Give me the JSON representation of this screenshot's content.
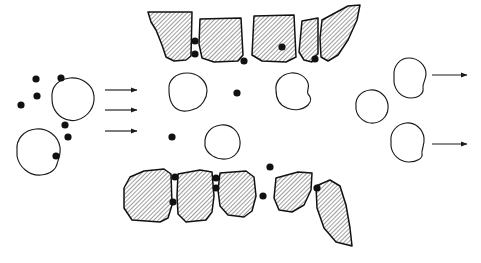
{
  "figure": {
    "domain_note": "schematic line diagram, black ink on white, no text labels",
    "background_color": "#ffffff",
    "ink_color": "#1a1a1a",
    "particle_color": "#111111",
    "hatch_color": "#1a1a1a",
    "width": 481,
    "height": 263,
    "stroke_width": 1.15,
    "hatch_angle_deg": 45,
    "hatch_spacing_px": 3
  },
  "regions": {
    "inlet": {
      "name": "inlet-region",
      "description": "feed side: large blobs plus scattered small particles"
    },
    "barrier": {
      "name": "barrier-region",
      "description": "two fractured hatched screen structures forming a throat"
    },
    "outlet": {
      "name": "outlet-region",
      "description": "discharge side: blobs only, particles retained upstream"
    }
  },
  "arrows": {
    "inlet": [
      {
        "name": "inlet-flow-arrow-1",
        "x1": 105,
        "y1": 90,
        "x2": 137,
        "y2": 90
      },
      {
        "name": "inlet-flow-arrow-2",
        "x1": 105,
        "y1": 110,
        "x2": 137,
        "y2": 110
      },
      {
        "name": "inlet-flow-arrow-3",
        "x1": 105,
        "y1": 131,
        "x2": 137,
        "y2": 131
      }
    ],
    "outlet": [
      {
        "name": "outlet-flow-arrow-1",
        "x1": 432,
        "y1": 75,
        "x2": 467,
        "y2": 75
      },
      {
        "name": "outlet-flow-arrow-2",
        "x1": 432,
        "y1": 144,
        "x2": 467,
        "y2": 144
      }
    ],
    "head_length": 7,
    "head_width": 5
  },
  "blobs": [
    {
      "name": "inlet-blob-upper",
      "cx": 72,
      "cy": 100,
      "rx": 22,
      "ry": 20,
      "path": "M 52 98 C 51 86 59 79 70 78 C 82 77 93 85 94 96 C 95 107 88 117 77 120 C 66 123 56 115 53 106 C 52 103 52 100 52 98 Z"
    },
    {
      "name": "inlet-blob-lower",
      "cx": 38,
      "cy": 152,
      "rx": 22,
      "ry": 21,
      "path": "M 17 150 C 16 139 24 130 36 129 C 48 128 58 136 60 147 C 61 155 58 160 57 164 C 56 169 51 174 41 175 C 29 176 19 167 17 156 C 17 154 17 152 17 150 Z"
    },
    {
      "name": "throat-blob-upper-left",
      "cx": 187,
      "cy": 93,
      "rx": 20,
      "ry": 18,
      "path": "M 169 90 C 168 80 176 73 187 73 C 198 73 207 81 207 91 C 207 99 201 106 197 108 C 192 110 185 113 179 110 C 172 107 169 99 169 90 Z"
    },
    {
      "name": "throat-blob-upper-right",
      "cx": 293,
      "cy": 92,
      "rx": 18,
      "ry": 17,
      "path": "M 276 90 C 275 81 282 74 291 73 C 299 72 306 77 308 83 C 310 88 306 91 308 94 C 311 97 312 101 308 105 C 303 110 294 111 287 108 C 279 105 276 98 276 90 Z"
    },
    {
      "name": "throat-blob-lower",
      "cx": 222,
      "cy": 142,
      "rx": 18,
      "ry": 17,
      "path": "M 205 144 C 204 134 211 126 221 125 C 231 124 239 131 240 141 C 241 150 235 158 226 159 C 216 160 207 154 205 146 C 205 145 205 144 205 144 Z"
    },
    {
      "name": "outlet-blob-upper",
      "cx": 410,
      "cy": 78,
      "rx": 17,
      "ry": 19,
      "path": "M 394 76 C 393 66 400 58 409 58 C 418 58 426 65 426 74 C 426 80 422 84 423 88 C 424 93 419 98 411 98 C 402 98 395 91 394 82 C 394 80 394 78 394 76 Z"
    },
    {
      "name": "outlet-blob-middle",
      "cx": 372,
      "cy": 108,
      "rx": 17,
      "ry": 16,
      "path": "M 356 106 C 355 98 361 91 370 90 C 379 89 387 96 388 105 C 389 114 383 122 374 123 C 365 124 357 117 356 109 C 356 108 356 107 356 106 Z"
    },
    {
      "name": "outlet-blob-lower",
      "cx": 407,
      "cy": 143,
      "rx": 17,
      "ry": 17,
      "path": "M 391 141 C 390 132 397 124 406 123 C 415 122 423 129 424 138 C 425 145 421 150 422 154 C 423 158 417 162 409 162 C 400 162 392 155 391 146 C 391 144 391 142 391 141 Z"
    }
  ],
  "particles": {
    "radius": 3.6,
    "inlet": [
      {
        "name": "inlet-particle-1",
        "cx": 36,
        "cy": 79
      },
      {
        "name": "inlet-particle-2",
        "cx": 61,
        "cy": 78
      },
      {
        "name": "inlet-particle-3",
        "cx": 37,
        "cy": 96
      },
      {
        "name": "inlet-particle-4",
        "cx": 21,
        "cy": 105
      },
      {
        "name": "inlet-particle-5",
        "cx": 65,
        "cy": 125
      },
      {
        "name": "inlet-particle-6",
        "cx": 68,
        "cy": 137
      },
      {
        "name": "inlet-particle-7",
        "cx": 56,
        "cy": 156
      }
    ],
    "trapped_top": [
      {
        "name": "trapped-particle-top-gap1-upper",
        "cx": 195,
        "cy": 41
      },
      {
        "name": "trapped-particle-top-gap1-lower",
        "cx": 195,
        "cy": 54
      },
      {
        "name": "trapped-particle-top-gap2",
        "cx": 244,
        "cy": 61
      },
      {
        "name": "trapped-particle-top-gap3",
        "cx": 282,
        "cy": 47
      },
      {
        "name": "trapped-particle-top-wedged",
        "cx": 315,
        "cy": 59
      }
    ],
    "throat": [
      {
        "name": "throat-particle-center",
        "cx": 237,
        "cy": 93
      },
      {
        "name": "throat-particle-left",
        "cx": 172,
        "cy": 137
      }
    ],
    "trapped_bottom": [
      {
        "name": "trapped-particle-bottom-gap1-upper",
        "cx": 175,
        "cy": 177
      },
      {
        "name": "trapped-particle-bottom-gap1-lower",
        "cx": 173,
        "cy": 202
      },
      {
        "name": "trapped-particle-bottom-gap2-upper",
        "cx": 216,
        "cy": 178
      },
      {
        "name": "trapped-particle-bottom-gap2-lower",
        "cx": 216,
        "cy": 188
      },
      {
        "name": "trapped-particle-bottom-gap3",
        "cx": 270,
        "cy": 167
      },
      {
        "name": "trapped-particle-bottom-gap4",
        "cx": 263,
        "cy": 196
      },
      {
        "name": "trapped-particle-bottom-right",
        "cx": 317,
        "cy": 188
      }
    ]
  },
  "barrier_top": {
    "name": "upper-screen-structure",
    "blocks": [
      {
        "name": "upper-screen-block-1",
        "path": "M 148 12 L 192 12 L 191 56 L 186 60 L 174 61 L 166 57 L 162 45 L 156 30 L 151 22 Z"
      },
      {
        "name": "upper-screen-block-2",
        "path": "M 200 19 L 241 18 L 243 55 L 238 61 L 214 62 L 202 58 L 199 44 Z"
      },
      {
        "name": "upper-screen-block-3",
        "path": "M 254 16 L 294 15 L 296 57 L 286 62 L 262 61 L 252 55 Z"
      },
      {
        "name": "upper-screen-block-4",
        "path": "M 302 21 L 318 18 L 318 54 L 314 57 L 312 62 L 304 60 L 299 52 Z"
      },
      {
        "name": "upper-screen-block-5",
        "path": "M 322 20 L 348 6 L 360 5 L 357 20 L 348 40 L 338 55 L 328 61 L 321 57 L 320 38 Z"
      }
    ]
  },
  "barrier_bottom": {
    "name": "lower-screen-structure",
    "blocks": [
      {
        "name": "lower-screen-block-1",
        "path": "M 124 188 L 130 177 L 144 171 L 164 169 L 171 174 L 172 205 L 168 218 L 160 222 L 132 220 L 124 208 Z"
      },
      {
        "name": "lower-screen-block-2",
        "path": "M 178 174 L 200 170 L 212 172 L 214 196 L 212 212 L 206 220 L 186 222 L 178 214 L 177 196 Z"
      },
      {
        "name": "lower-screen-block-3",
        "path": "M 220 173 L 246 171 L 254 177 L 256 196 L 252 211 L 244 217 L 228 215 L 220 206 L 218 190 Z"
      },
      {
        "name": "lower-screen-block-4",
        "path": "M 276 178 L 298 172 L 312 173 L 311 190 L 304 205 L 292 212 L 279 210 L 274 198 Z"
      },
      {
        "name": "lower-screen-block-5",
        "path": "M 316 186 L 330 180 L 340 186 L 346 205 L 350 228 L 352 246 L 336 242 L 324 228 L 317 208 Z"
      }
    ]
  }
}
